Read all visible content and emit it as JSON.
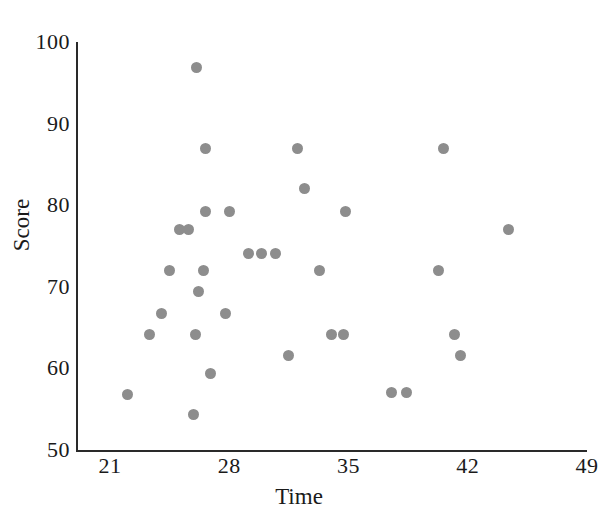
{
  "chart_data": {
    "type": "scatter",
    "title": "",
    "xlabel": "Time",
    "ylabel": "Score",
    "xlim": [
      19.0,
      49.0
    ],
    "ylim": [
      50,
      100
    ],
    "xticks": [
      21,
      28,
      35,
      42,
      49
    ],
    "yticks": [
      50,
      60,
      70,
      80,
      90,
      100
    ],
    "grid": false,
    "legend": null,
    "marker": {
      "shape": "circle",
      "color": "#8d8d8d",
      "size_px": 11
    },
    "axis_color": "#2a2a2a",
    "background_color": "#ffffff",
    "n_points": 37,
    "points": [
      {
        "x": 26.1,
        "y": 96.9
      },
      {
        "x": 26.6,
        "y": 87.0
      },
      {
        "x": 32.0,
        "y": 87.0
      },
      {
        "x": 40.6,
        "y": 87.0
      },
      {
        "x": 32.4,
        "y": 82.1
      },
      {
        "x": 26.6,
        "y": 79.2
      },
      {
        "x": 28.0,
        "y": 79.2
      },
      {
        "x": 34.8,
        "y": 79.2
      },
      {
        "x": 44.4,
        "y": 77.0
      },
      {
        "x": 25.1,
        "y": 77.0
      },
      {
        "x": 25.6,
        "y": 77.0
      },
      {
        "x": 29.1,
        "y": 74.1
      },
      {
        "x": 29.9,
        "y": 74.1
      },
      {
        "x": 30.7,
        "y": 74.1
      },
      {
        "x": 24.5,
        "y": 72.0
      },
      {
        "x": 26.5,
        "y": 72.0
      },
      {
        "x": 33.3,
        "y": 72.0
      },
      {
        "x": 40.3,
        "y": 72.0
      },
      {
        "x": 26.2,
        "y": 69.4
      },
      {
        "x": 24.0,
        "y": 66.7
      },
      {
        "x": 27.8,
        "y": 66.7
      },
      {
        "x": 23.3,
        "y": 64.2
      },
      {
        "x": 26.0,
        "y": 64.2
      },
      {
        "x": 34.0,
        "y": 64.2
      },
      {
        "x": 34.7,
        "y": 64.2
      },
      {
        "x": 41.2,
        "y": 64.2
      },
      {
        "x": 31.5,
        "y": 61.6
      },
      {
        "x": 41.6,
        "y": 61.6
      },
      {
        "x": 26.9,
        "y": 59.4
      },
      {
        "x": 37.5,
        "y": 57.0
      },
      {
        "x": 38.4,
        "y": 57.0
      },
      {
        "x": 22.0,
        "y": 56.8
      },
      {
        "x": 25.9,
        "y": 54.3
      }
    ]
  },
  "axes": {
    "y_title": "Score",
    "x_title": "Time",
    "y_tick_labels": [
      "100",
      "90",
      "80",
      "70",
      "60",
      "50"
    ],
    "x_tick_labels": [
      "21",
      "28",
      "35",
      "42",
      "49"
    ]
  }
}
